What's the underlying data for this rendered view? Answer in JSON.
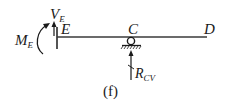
{
  "diagram": {
    "caption": "(f)",
    "beam": {
      "points": [
        {
          "id": "E",
          "label": "E"
        },
        {
          "id": "C",
          "label": "C"
        },
        {
          "id": "D",
          "label": "D"
        }
      ]
    },
    "loads": {
      "shear": {
        "main": "V",
        "sub": "E"
      },
      "moment": {
        "main": "M",
        "sub": "E"
      },
      "reaction": {
        "main": "R",
        "sub": "CV"
      }
    },
    "colors": {
      "ink": "#1a1a1a"
    }
  }
}
